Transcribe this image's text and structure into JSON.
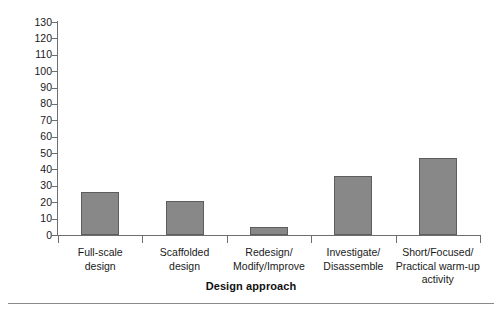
{
  "chart_data": {
    "type": "bar",
    "title": "",
    "subtitle": "",
    "xlabel": "Design approach",
    "ylabel": "",
    "categories": [
      "Full-scale design",
      "Scaffolded design",
      "Redesign/ Modify/Improve",
      "Investigate/ Disassemble",
      "Short/Focused/ Practical warm-up activity"
    ],
    "category_lines": [
      [
        "Full-scale",
        "design"
      ],
      [
        "Scaffolded",
        "design"
      ],
      [
        "Redesign/",
        "Modify/Improve"
      ],
      [
        "Investigate/",
        "Disassemble"
      ],
      [
        "Short/Focused/",
        "Practical warm-up",
        "activity"
      ]
    ],
    "values": [
      26,
      21,
      5,
      36,
      47
    ],
    "ylim": [
      0,
      130
    ],
    "ytick_step": 10,
    "yticks": [
      0,
      10,
      20,
      30,
      40,
      50,
      60,
      70,
      80,
      90,
      100,
      110,
      120,
      130
    ],
    "ytick_labels": [
      "0",
      "10",
      "20",
      "30",
      "40",
      "50",
      "60",
      "70",
      "80",
      "90",
      "100",
      "110",
      "120",
      "130"
    ],
    "grid": false,
    "legend": false,
    "legend_position": "none",
    "bar_color": "#888888",
    "bar_edge_color": "#5d5d5d",
    "axis_color": "#6e6e6e",
    "background_color": "#ffffff"
  }
}
